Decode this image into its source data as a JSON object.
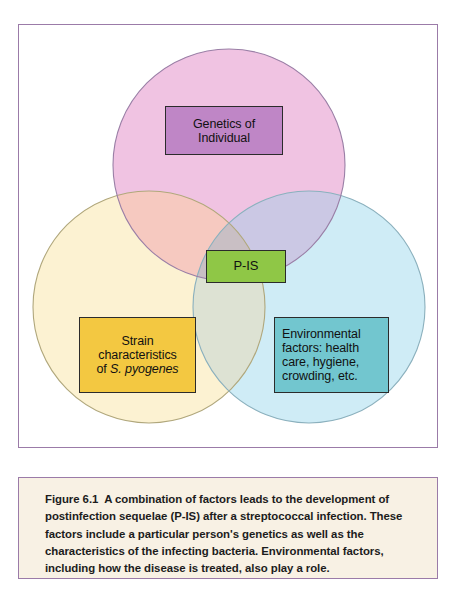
{
  "figure": {
    "frame_border_color": "#9b7ba8",
    "background_color": "#ffffff"
  },
  "diagram": {
    "type": "venn-3-circle",
    "circles": [
      {
        "name": "genetics-circle",
        "label": "Genetics of Individual",
        "fill_color": "#f0c3e2",
        "stroke_color": "#9a7fa6",
        "cx": 210,
        "cy": 140,
        "r": 116
      },
      {
        "name": "strain-circle",
        "label": "Strain characteristics of S. pyogenes",
        "fill_color": "#fcf2d2",
        "stroke_color": "#b5ab7e",
        "cx": 130,
        "cy": 282,
        "r": 116
      },
      {
        "name": "environmental-circle",
        "label": "Environmental factors",
        "fill_color": "#cfecf6",
        "stroke_color": "#86adbb",
        "cx": 290,
        "cy": 282,
        "r": 116
      }
    ],
    "overlap_colors": {
      "genetics_strain": "#f6c9c0",
      "genetics_environmental": "#cbc8e4",
      "strain_environmental": "#dde2d3",
      "all_three": "#c9bfc4"
    },
    "boxes": [
      {
        "name": "genetics-box",
        "lines": [
          "Genetics of",
          "Individual"
        ],
        "fill_color": "#bf86c6",
        "border_color": "#2b2b2b",
        "text_color": "#111111",
        "align": "center"
      },
      {
        "name": "pis-box",
        "lines": [
          "P-IS"
        ],
        "fill_color": "#8fc746",
        "border_color": "#2b2b2b",
        "text_color": "#111111",
        "align": "center"
      },
      {
        "name": "strain-box",
        "lines": [
          "Strain",
          "characteristics",
          "of "
        ],
        "italic_part": "S. pyogenes",
        "fill_color": "#f3c841",
        "border_color": "#2b2b2b",
        "text_color": "#111111",
        "align": "center"
      },
      {
        "name": "environmental-box",
        "lines": [
          "Environmental",
          "factors: health",
          "care, hygiene,",
          "crowding, etc."
        ],
        "fill_color": "#72c6cf",
        "border_color": "#2b2b2b",
        "text_color": "#111111",
        "align": "left"
      }
    ]
  },
  "caption": {
    "figure_number": "Figure 6.1",
    "body": "A combination of factors leads to the development of postinfection sequelae (P-IS) after a streptococcal infection. These factors include a particular person's genetics as well as the characteristics of the infecting bacteria. Environmental factors, including how the disease is treated, also play a role.",
    "background_color": "#f8f1e4",
    "border_color": "#9b7ba8"
  }
}
